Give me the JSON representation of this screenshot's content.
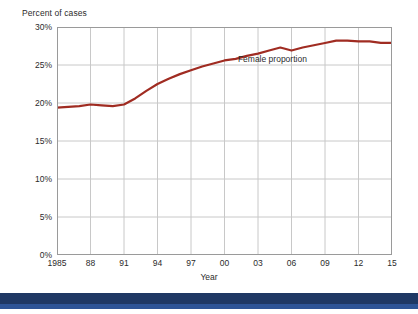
{
  "chart_data": {
    "type": "line",
    "title": "",
    "ylabel": "Percent of cases",
    "xlabel": "Year",
    "ylim": [
      0,
      30
    ],
    "ytick_labels": [
      "0%",
      "5%",
      "10%",
      "15%",
      "20%",
      "25%",
      "30%"
    ],
    "ytick_values": [
      0,
      5,
      10,
      15,
      20,
      25,
      30
    ],
    "xlim": [
      1985,
      2015
    ],
    "xtick_labels": [
      "1985",
      "88",
      "91",
      "94",
      "97",
      "00",
      "03",
      "06",
      "09",
      "12",
      "15"
    ],
    "xtick_values": [
      1985,
      1988,
      1991,
      1994,
      1997,
      2000,
      2003,
      2006,
      2009,
      2012,
      2015
    ],
    "grid": true,
    "legend": "none",
    "series": [
      {
        "name": "Female proportion",
        "color": "#a02c22",
        "x": [
          1985,
          1986,
          1987,
          1988,
          1989,
          1990,
          1991,
          1992,
          1993,
          1994,
          1995,
          1996,
          1997,
          1998,
          1999,
          2000,
          2001,
          2002,
          2003,
          2004,
          2005,
          2006,
          2007,
          2008,
          2009,
          2010,
          2011,
          2012,
          2013,
          2014,
          2015
        ],
        "values": [
          19.4,
          19.5,
          19.6,
          19.8,
          19.7,
          19.6,
          19.8,
          20.6,
          21.6,
          22.5,
          23.2,
          23.8,
          24.3,
          24.8,
          25.2,
          25.6,
          25.8,
          26.2,
          26.5,
          26.9,
          27.3,
          26.9,
          27.3,
          27.6,
          27.9,
          28.2,
          28.2,
          28.1,
          28.1,
          27.9,
          27.9
        ]
      }
    ],
    "annotations": [
      {
        "text": "Female proportion",
        "x": 2001.2,
        "y": 25.6
      }
    ],
    "colors": {
      "line": "#a02c22",
      "grid": "#c8c8c8",
      "axis": "#7f7f7f",
      "text": "#2b2b2b",
      "background": "#ffffff",
      "footer_dark": "#1f3864",
      "footer_light": "#2e5496"
    }
  }
}
